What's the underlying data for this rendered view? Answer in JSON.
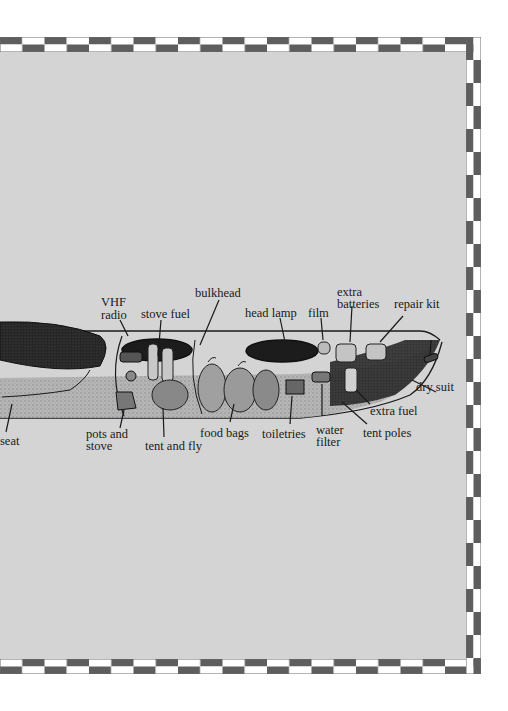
{
  "diagram": {
    "colors": {
      "panel_background": "#d4d4d4",
      "border_dark": "#5e5e5e",
      "border_light": "#ffffff",
      "ink": "#1a1a1a"
    },
    "labels": [
      {
        "id": "seat",
        "text": "seat"
      },
      {
        "id": "vhf_radio",
        "line1": "VHF",
        "line2": "radio"
      },
      {
        "id": "stove_fuel",
        "text": "stove fuel"
      },
      {
        "id": "bulkhead",
        "text": "bulkhead"
      },
      {
        "id": "head_lamp",
        "text": "head lamp"
      },
      {
        "id": "film",
        "text": "film"
      },
      {
        "id": "extra_batteries",
        "line1": "extra",
        "line2": "batteries"
      },
      {
        "id": "repair_kit",
        "text": "repair kit"
      },
      {
        "id": "dry_suit",
        "text": "dry suit"
      },
      {
        "id": "extra_fuel",
        "text": "extra fuel"
      },
      {
        "id": "tent_poles",
        "text": "tent poles"
      },
      {
        "id": "water_filter",
        "line1": "water",
        "line2": "filter"
      },
      {
        "id": "toiletries",
        "text": "toiletries"
      },
      {
        "id": "food_bags",
        "text": "food bags"
      },
      {
        "id": "tent_and_fly",
        "text": "tent and fly"
      },
      {
        "id": "pots_and_stove",
        "line1": "pots and",
        "line2": "stove"
      }
    ]
  }
}
